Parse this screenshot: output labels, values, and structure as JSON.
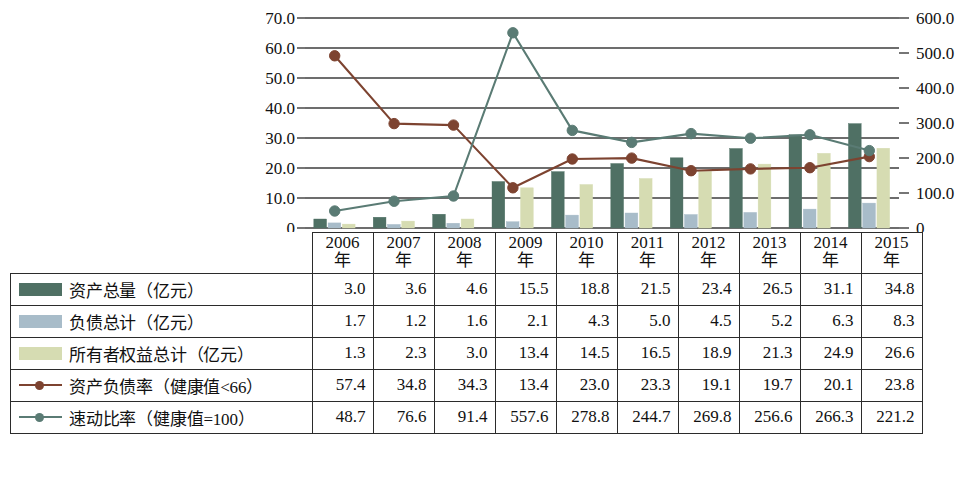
{
  "chart_data": {
    "type": "bar",
    "title": "",
    "xlabel": "",
    "ylabel": "",
    "grid": true,
    "legend_position": "table-below",
    "categories": [
      "2006年",
      "2007年",
      "2008年",
      "2009年",
      "2010年",
      "2011年",
      "2012年",
      "2013年",
      "2014年",
      "2015年"
    ],
    "axes": {
      "left": {
        "ylim": [
          0,
          70
        ],
        "ticks": [
          "0",
          "10.0",
          "20.0",
          "30.0",
          "40.0",
          "50.0",
          "60.0",
          "70.0"
        ],
        "tick_values": [
          0,
          10,
          20,
          30,
          40,
          50,
          60,
          70
        ]
      },
      "right": {
        "ylim": [
          0,
          600
        ],
        "ticks": [
          "0",
          "100.0",
          "200.0",
          "300.0",
          "400.0",
          "500.0",
          "600.0"
        ],
        "tick_values": [
          0,
          100,
          200,
          300,
          400,
          500,
          600
        ]
      }
    },
    "series": [
      {
        "name": "资产总量（亿元）",
        "kind": "bar",
        "axis": "left",
        "color": "#4f7064",
        "values": [
          3.0,
          3.6,
          4.6,
          15.5,
          18.8,
          21.5,
          23.4,
          26.5,
          31.1,
          34.8
        ]
      },
      {
        "name": "负债总计（亿元）",
        "kind": "bar",
        "axis": "left",
        "color": "#a8bcc9",
        "values": [
          1.7,
          1.2,
          1.6,
          2.1,
          4.3,
          5.0,
          4.5,
          5.2,
          6.3,
          8.3
        ]
      },
      {
        "name": "所有者权益总计（亿元）",
        "kind": "bar",
        "axis": "left",
        "color": "#d6dcb2",
        "values": [
          1.3,
          2.3,
          3.0,
          13.4,
          14.5,
          16.5,
          18.9,
          21.3,
          24.9,
          26.6
        ]
      },
      {
        "name": "资产负债率（健康值<66）",
        "kind": "line",
        "axis": "left",
        "color": "#7d4330",
        "values": [
          57.4,
          34.8,
          34.3,
          13.4,
          23.0,
          23.3,
          19.1,
          19.7,
          20.1,
          23.8
        ]
      },
      {
        "name": "速动比率（健康值=100）",
        "kind": "line",
        "axis": "right",
        "color": "#5a7b74",
        "values": [
          48.7,
          76.6,
          91.4,
          557.6,
          278.8,
          244.7,
          269.8,
          256.6,
          266.3,
          221.2
        ]
      }
    ]
  },
  "table": {
    "corner_label": "",
    "year_headers": [
      {
        "top": "2006",
        "bottom": "年"
      },
      {
        "top": "2007",
        "bottom": "年"
      },
      {
        "top": "2008",
        "bottom": "年"
      },
      {
        "top": "2009",
        "bottom": "年"
      },
      {
        "top": "2010",
        "bottom": "年"
      },
      {
        "top": "2011",
        "bottom": "年"
      },
      {
        "top": "2012",
        "bottom": "年"
      },
      {
        "top": "2013",
        "bottom": "年"
      },
      {
        "top": "2014",
        "bottom": "年"
      },
      {
        "top": "2015",
        "bottom": "年"
      }
    ],
    "rows": [
      {
        "label": "资产总量（亿元）",
        "marker": "bar",
        "color": "#4f7064",
        "values": [
          "3.0",
          "3.6",
          "4.6",
          "15.5",
          "18.8",
          "21.5",
          "23.4",
          "26.5",
          "31.1",
          "34.8"
        ]
      },
      {
        "label": "负债总计（亿元）",
        "marker": "bar",
        "color": "#a8bcc9",
        "values": [
          "1.7",
          "1.2",
          "1.6",
          "2.1",
          "4.3",
          "5.0",
          "4.5",
          "5.2",
          "6.3",
          "8.3"
        ]
      },
      {
        "label": "所有者权益总计（亿元）",
        "marker": "bar",
        "color": "#d6dcb2",
        "values": [
          "1.3",
          "2.3",
          "3.0",
          "13.4",
          "14.5",
          "16.5",
          "18.9",
          "21.3",
          "24.9",
          "26.6"
        ]
      },
      {
        "label": "资产负债率（健康值<66）",
        "marker": "line",
        "color": "#7d4330",
        "values": [
          "57.4",
          "34.8",
          "34.3",
          "13.4",
          "23.0",
          "23.3",
          "19.1",
          "19.7",
          "20.1",
          "23.8"
        ]
      },
      {
        "label": "速动比率（健康值=100）",
        "marker": "line",
        "color": "#5a7b74",
        "values": [
          "48.7",
          "76.6",
          "91.4",
          "557.6",
          "278.8",
          "244.7",
          "269.8",
          "256.6",
          "266.3",
          "221.2"
        ]
      }
    ]
  },
  "colors": {
    "assets_bar": "#4f7064",
    "liabilities_bar": "#a8bcc9",
    "equity_bar": "#d6dcb2",
    "ratio_line": "#7d4330",
    "quick_line": "#5a7b74",
    "gridline": "#3c3c3c",
    "table_border": "#2b2b2b"
  }
}
